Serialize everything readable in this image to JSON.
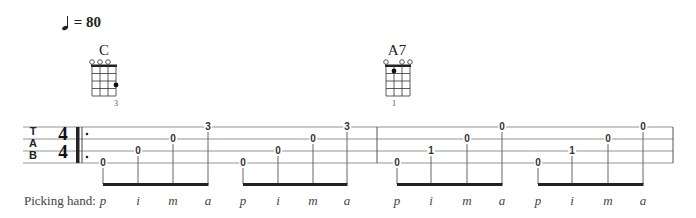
{
  "tempo": {
    "symbol": "quarter-note",
    "text": "= 80"
  },
  "chords": [
    {
      "name": "C",
      "x": 92,
      "open_strings": [
        1,
        2,
        3
      ],
      "dots": [
        {
          "string": 4,
          "fret": 3
        }
      ],
      "fingers": [
        {
          "string": 4,
          "label": "3"
        }
      ]
    },
    {
      "name": "A7",
      "x": 385,
      "open_strings": [
        1,
        3,
        4
      ],
      "dots": [
        {
          "string": 2,
          "fret": 1
        }
      ],
      "fingers": [
        {
          "string": 2,
          "label": "1"
        }
      ]
    }
  ],
  "tab": {
    "clef": [
      "T",
      "A",
      "B"
    ],
    "time_signature": {
      "top": "4",
      "bottom": "4"
    },
    "measures": [
      {
        "groups": [
          {
            "notes": [
              {
                "x": 103,
                "string": 4,
                "fret": "0"
              },
              {
                "x": 138,
                "string": 3,
                "fret": "0"
              },
              {
                "x": 173,
                "string": 2,
                "fret": "0"
              },
              {
                "x": 208,
                "string": 1,
                "fret": "3"
              }
            ]
          },
          {
            "notes": [
              {
                "x": 243,
                "string": 4,
                "fret": "0"
              },
              {
                "x": 278,
                "string": 3,
                "fret": "0"
              },
              {
                "x": 313,
                "string": 2,
                "fret": "0"
              },
              {
                "x": 347,
                "string": 1,
                "fret": "3"
              }
            ]
          }
        ]
      },
      {
        "groups": [
          {
            "notes": [
              {
                "x": 397,
                "string": 4,
                "fret": "0"
              },
              {
                "x": 431,
                "string": 3,
                "fret": "1"
              },
              {
                "x": 467,
                "string": 2,
                "fret": "0"
              },
              {
                "x": 502,
                "string": 1,
                "fret": "0"
              }
            ]
          },
          {
            "notes": [
              {
                "x": 538,
                "string": 4,
                "fret": "0"
              },
              {
                "x": 572,
                "string": 3,
                "fret": "1"
              },
              {
                "x": 608,
                "string": 2,
                "fret": "0"
              },
              {
                "x": 643,
                "string": 1,
                "fret": "0"
              }
            ]
          }
        ]
      }
    ]
  },
  "picking_hand": {
    "label": "Picking hand:",
    "fingers": [
      "p",
      "i",
      "m",
      "a",
      "p",
      "i",
      "m",
      "a",
      "p",
      "i",
      "m",
      "a",
      "p",
      "i",
      "m",
      "a"
    ]
  }
}
